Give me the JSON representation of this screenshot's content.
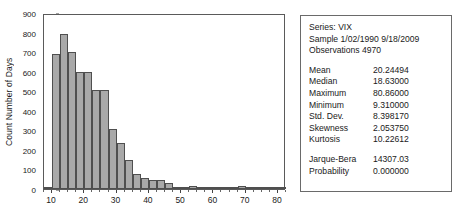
{
  "chart_data": {
    "type": "bar",
    "title": "",
    "xlabel": "",
    "ylabel": "Count Number of Days",
    "ylim": [
      0,
      900
    ],
    "xlim": [
      7.5,
      82.5
    ],
    "grid": false,
    "legend": null,
    "bin_width": 2.5,
    "categories": [
      "8.75",
      "11.25",
      "13.75",
      "16.25",
      "18.75",
      "21.25",
      "23.75",
      "26.25",
      "28.75",
      "31.25",
      "33.75",
      "36.25",
      "38.75",
      "41.25",
      "43.75",
      "46.25",
      "48.75",
      "51.25",
      "53.75",
      "56.25",
      "58.75",
      "61.25",
      "63.75",
      "66.25",
      "68.75",
      "71.25",
      "73.75",
      "76.25",
      "78.75",
      "81.25"
    ],
    "values": [
      10,
      700,
      800,
      710,
      605,
      605,
      510,
      510,
      310,
      240,
      150,
      80,
      55,
      45,
      48,
      30,
      12,
      10,
      14,
      8,
      6,
      5,
      6,
      5,
      14,
      4,
      3,
      2,
      2,
      3
    ],
    "yticks": [
      0,
      100,
      200,
      300,
      400,
      500,
      600,
      700,
      800,
      900
    ],
    "xticks": [
      10,
      20,
      30,
      40,
      50,
      60,
      70,
      80
    ]
  },
  "stats": {
    "series_label": "Series: VIX",
    "sample_label": "Sample 1/02/1990 9/18/2009",
    "observations_label": "Observations 4970",
    "rows": [
      {
        "key": "Mean",
        "value": "20.24494"
      },
      {
        "key": "Median",
        "value": "18.63000"
      },
      {
        "key": "Maximum",
        "value": "80.86000"
      },
      {
        "key": "Minimum",
        "value": "9.310000"
      },
      {
        "key": "Std. Dev.",
        "value": "8.398170"
      },
      {
        "key": "Skewness",
        "value": "2.053750"
      },
      {
        "key": "Kurtosis",
        "value": "10.22612"
      }
    ],
    "test_rows": [
      {
        "key": "Jarque-Bera",
        "value": "14307.03"
      },
      {
        "key": "Probability",
        "value": "0.000000"
      }
    ]
  },
  "colors": {
    "bar_fill": "#a9a9a9",
    "bar_stroke": "#4f4f4f",
    "frame": "#5a5a5a",
    "text": "#1a1a1a"
  }
}
